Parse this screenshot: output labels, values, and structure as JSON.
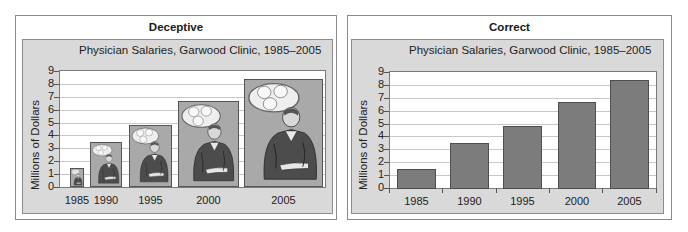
{
  "panels": {
    "deceptive": {
      "heading": "Deceptive",
      "chart_title": "Physician Salaries, Garwood Clinic, 1985–2005",
      "ylabel": "Millions of Dollars",
      "y_ticks": [
        "0",
        "1",
        "2",
        "3",
        "4",
        "5",
        "6",
        "7",
        "8",
        "9"
      ],
      "x_ticks": [
        "1985",
        "1990",
        "1995",
        "2000",
        "2005"
      ]
    },
    "correct": {
      "heading": "Correct",
      "chart_title": "Physician Salaries, Garwood Clinic, 1985–2005",
      "ylabel": "Millions of Dollars",
      "y_ticks": [
        "0",
        "1",
        "2",
        "3",
        "4",
        "5",
        "6",
        "7",
        "8",
        "9"
      ],
      "x_ticks": [
        "1985",
        "1990",
        "1995",
        "2000",
        "2005"
      ]
    }
  },
  "colors": {
    "chart_background": "#d9d9d9",
    "bar_fill": "#7c7c7c",
    "pictograph_background": "#a9a9a9"
  },
  "chart_data": [
    {
      "type": "bar",
      "style": "pictograph",
      "panel_heading": "Deceptive",
      "title": "Physician Salaries, Garwood Clinic, 1985–2005",
      "xlabel": "",
      "ylabel": "Millions of Dollars",
      "categories": [
        "1985",
        "1990",
        "1995",
        "2000",
        "2005"
      ],
      "values": [
        1.5,
        3.5,
        4.8,
        6.7,
        8.4
      ],
      "ylim": [
        0,
        9
      ],
      "grid": true,
      "legend": null,
      "note": "Bar widths scale with height (pictures of a physician), exaggerating growth"
    },
    {
      "type": "bar",
      "panel_heading": "Correct",
      "title": "Physician Salaries, Garwood Clinic, 1985–2005",
      "xlabel": "",
      "ylabel": "Millions of Dollars",
      "categories": [
        "1985",
        "1990",
        "1995",
        "2000",
        "2005"
      ],
      "values": [
        1.5,
        3.5,
        4.8,
        6.7,
        8.4
      ],
      "ylim": [
        0,
        9
      ],
      "grid": true,
      "legend": null
    }
  ]
}
